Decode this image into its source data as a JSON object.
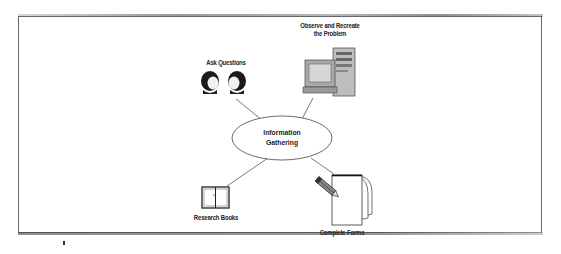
{
  "diagram": {
    "center": {
      "label_line1": "Information",
      "label_line2": "Gathering",
      "shape": "ellipse"
    },
    "nodes": [
      {
        "id": "ask-questions",
        "label": "Ask Questions",
        "icon": "two-faces-icon"
      },
      {
        "id": "observe-recreate",
        "label_line1": "Observe and Recreate",
        "label_line2": "the Problem",
        "icon": "computer-icon"
      },
      {
        "id": "research-books",
        "label": "Research Books",
        "icon": "open-book-icon"
      },
      {
        "id": "complete-forms",
        "label": "Complete Forms",
        "icon": "form-with-pencil-icon"
      }
    ],
    "colors": {
      "line": "#555555",
      "text": "#222222",
      "border": "#666666",
      "background": "#ffffff"
    }
  }
}
